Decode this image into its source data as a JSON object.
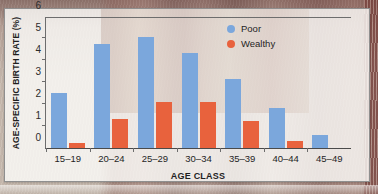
{
  "chart_data": {
    "type": "bar",
    "title": "",
    "xlabel": "AGE CLASS",
    "ylabel": "AGE-SPECIFIC BIRTH RATE (%)",
    "categories": [
      "15–19",
      "20–24",
      "25–29",
      "30–34",
      "35–39",
      "40–44",
      "45–49"
    ],
    "series": [
      {
        "name": "Poor",
        "color": "#7ba7dc",
        "values": [
          2.5,
          4.75,
          5.05,
          4.3,
          3.15,
          1.8,
          0.6
        ]
      },
      {
        "name": "Wealthy",
        "color": "#e8623d",
        "values": [
          0.25,
          1.3,
          2.1,
          2.1,
          1.25,
          0.3,
          0.0
        ]
      }
    ],
    "ylim": [
      0,
      6
    ],
    "yticks": [
      0,
      1,
      2,
      3,
      4,
      5,
      6
    ],
    "ytick_labels": [
      "0",
      "1",
      "2",
      "3",
      "4",
      "5",
      "6"
    ],
    "grid": false,
    "legend_position": "top-right"
  },
  "axes": {
    "y_title": "AGE-SPECIFIC BIRTH RATE (%)",
    "x_title": "AGE CLASS"
  },
  "legend": {
    "items": [
      {
        "label": "Poor",
        "swatch": "poor-legend-swatch"
      },
      {
        "label": "Wealthy",
        "swatch": "wealthy-legend-swatch"
      }
    ]
  },
  "colors": {
    "poor": "#7ba7dc",
    "wealthy": "#e8623d",
    "axis": "#6d6d6d",
    "text": "#1f1f1f",
    "panel": "#fdfcfa"
  }
}
